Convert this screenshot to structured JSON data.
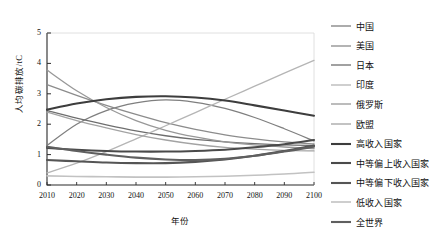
{
  "chart_data": {
    "type": "line",
    "title": "",
    "xlabel": "年份",
    "ylabel": "人均碳排放/tC",
    "xlim": [
      2010,
      2100
    ],
    "ylim": [
      0,
      5
    ],
    "grid": false,
    "legend_position": "right",
    "x": [
      2010,
      2020,
      2030,
      2040,
      2050,
      2060,
      2070,
      2080,
      2090,
      2100
    ],
    "xticks": [
      "2010",
      "2020",
      "2030",
      "2040",
      "2050",
      "2060",
      "2070",
      "2080",
      "2090",
      "2100"
    ],
    "yticks": [
      "0",
      "1",
      "2",
      "3",
      "4",
      "5"
    ],
    "series": [
      {
        "name": "中国",
        "color": "#7f7f7f",
        "width": 1.3,
        "values": [
          1.3,
          2.0,
          2.45,
          2.7,
          2.8,
          2.72,
          2.52,
          2.22,
          1.85,
          1.45
        ]
      },
      {
        "name": "美国",
        "color": "#8c8c8c",
        "width": 1.3,
        "values": [
          3.3,
          2.95,
          2.62,
          2.32,
          2.05,
          1.83,
          1.65,
          1.52,
          1.42,
          1.35
        ]
      },
      {
        "name": "日本",
        "color": "#6e6e6e",
        "width": 1.3,
        "values": [
          2.45,
          2.2,
          1.98,
          1.78,
          1.62,
          1.5,
          1.42,
          1.36,
          1.32,
          1.3
        ]
      },
      {
        "name": "印度",
        "color": "#b5b5b5",
        "width": 1.3,
        "values": [
          0.4,
          0.72,
          1.1,
          1.52,
          1.95,
          2.38,
          2.82,
          3.25,
          3.68,
          4.1
        ]
      },
      {
        "name": "俄罗斯",
        "color": "#989898",
        "width": 1.3,
        "values": [
          3.78,
          3.1,
          2.55,
          2.12,
          1.8,
          1.58,
          1.42,
          1.32,
          1.25,
          1.2
        ]
      },
      {
        "name": "欧盟",
        "color": "#a3a3a3",
        "width": 1.3,
        "values": [
          2.4,
          2.12,
          1.88,
          1.66,
          1.48,
          1.34,
          1.24,
          1.18,
          1.14,
          1.12
        ]
      },
      {
        "name": "高收入国家",
        "color": "#3d3d3d",
        "width": 2.1,
        "values": [
          2.48,
          2.68,
          2.82,
          2.9,
          2.92,
          2.88,
          2.78,
          2.62,
          2.45,
          2.28
        ]
      },
      {
        "name": "中等偏上收入国家",
        "color": "#4a4a4a",
        "width": 2.1,
        "values": [
          1.22,
          1.16,
          1.12,
          1.1,
          1.1,
          1.12,
          1.16,
          1.24,
          1.34,
          1.48
        ]
      },
      {
        "name": "中等偏下收入国家",
        "color": "#555555",
        "width": 2.1,
        "values": [
          0.82,
          0.78,
          0.74,
          0.72,
          0.72,
          0.76,
          0.84,
          0.96,
          1.12,
          1.3
        ]
      },
      {
        "name": "低收入国家",
        "color": "#c2c2c2",
        "width": 1.6,
        "values": [
          0.3,
          0.28,
          0.27,
          0.26,
          0.26,
          0.27,
          0.29,
          0.32,
          0.36,
          0.42
        ]
      },
      {
        "name": "全世界",
        "color": "#5f5f5f",
        "width": 2.1,
        "values": [
          1.26,
          1.12,
          1.0,
          0.9,
          0.84,
          0.82,
          0.86,
          0.96,
          1.1,
          1.26
        ]
      }
    ]
  }
}
